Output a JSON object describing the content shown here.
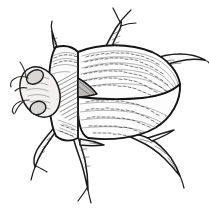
{
  "image": {
    "title": "Beetle line drawing",
    "subject": "beetle",
    "style": "black-ink pen-and-hatch illustration",
    "background_color": "#ffffff",
    "ink_color": "#1a1a1a",
    "shade_color": "#bdbbb9",
    "width": 209,
    "height": 209
  },
  "parts": [
    {
      "id": "head",
      "label": "head"
    },
    {
      "id": "eye",
      "label": "compound eye"
    },
    {
      "id": "antenna-upper",
      "label": "upper antenna"
    },
    {
      "id": "antenna-lower",
      "label": "lower antenna"
    },
    {
      "id": "pronotum",
      "label": "pronotum"
    },
    {
      "id": "scutellum",
      "label": "scutellum"
    },
    {
      "id": "elytron-upper",
      "label": "upper elytron"
    },
    {
      "id": "elytron-lower",
      "label": "lower elytron"
    },
    {
      "id": "elytral-suture",
      "label": "elytral suture"
    },
    {
      "id": "abdomen-tip",
      "label": "abdomen tip"
    },
    {
      "id": "leg-fore",
      "label": "foreleg"
    },
    {
      "id": "leg-mid",
      "label": "midleg"
    },
    {
      "id": "leg-hind",
      "label": "hindleg"
    },
    {
      "id": "leg-upper-front",
      "label": "upper front leg"
    },
    {
      "id": "leg-upper-rear",
      "label": "upper rear leg"
    },
    {
      "id": "leg-stub-top",
      "label": "top leg stub"
    }
  ],
  "texture": {
    "striation_label": "elytral striae",
    "hatching_label": "pronotum hatching",
    "bristle_label": "bristle hairs"
  }
}
